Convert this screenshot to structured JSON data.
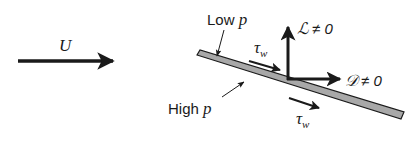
{
  "diagram": {
    "freestream": {
      "symbol": "U"
    },
    "plate": {
      "upper_side_label": "Low",
      "upper_side_var": "p",
      "lower_side_label": "High",
      "lower_side_var": "p",
      "fill_color": "#a8a8a8"
    },
    "forces": {
      "lift": {
        "symbol": "ℒ",
        "relation": "≠ 0"
      },
      "drag": {
        "symbol": "𝒟",
        "relation": "≠ 0"
      }
    },
    "shear_stress": {
      "top": {
        "symbol": "τ",
        "subscript": "w"
      },
      "bottom": {
        "symbol": "τ",
        "subscript": "w"
      }
    },
    "ink_color": "#1a1a1a"
  }
}
